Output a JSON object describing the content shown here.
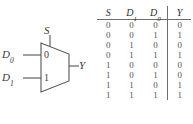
{
  "figure": {
    "kind": "2-to-1 multiplexer logic symbol with truth table"
  },
  "mux": {
    "select_label": "S",
    "input_labels": [
      "D",
      "D"
    ],
    "input_label_0": "D",
    "input_label_0_sub": "0",
    "input_label_1": "D",
    "input_label_1_sub": "1",
    "port_label_0": "0",
    "port_label_1": "1",
    "output_label": "Y",
    "stroke_color": "#555555"
  },
  "truth_table": {
    "headers": [
      {
        "base": "S",
        "sub": ""
      },
      {
        "base": "D",
        "sub": "1"
      },
      {
        "base": "D",
        "sub": "0"
      },
      {
        "base": "Y",
        "sub": ""
      }
    ],
    "header_labels": [
      "S",
      "D1",
      "D0",
      "Y"
    ],
    "rows": [
      {
        "S": "0",
        "D1": "0",
        "D0": "0",
        "Y": "0"
      },
      {
        "S": "0",
        "D1": "0",
        "D0": "1",
        "Y": "1"
      },
      {
        "S": "0",
        "D1": "1",
        "D0": "0",
        "Y": "0"
      },
      {
        "S": "0",
        "D1": "1",
        "D0": "1",
        "Y": "1"
      },
      {
        "S": "1",
        "D1": "0",
        "D0": "0",
        "Y": "0"
      },
      {
        "S": "1",
        "D1": "0",
        "D0": "1",
        "Y": "0"
      },
      {
        "S": "1",
        "D1": "1",
        "D0": "0",
        "Y": "1"
      },
      {
        "S": "1",
        "D1": "1",
        "D0": "1",
        "Y": "1"
      }
    ],
    "rule_color": "#6e6e6e"
  }
}
